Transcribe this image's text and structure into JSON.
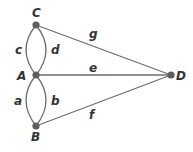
{
  "diagram": {
    "type": "graph",
    "colors": {
      "edge": "#6d6d6d",
      "node": "#5e5e5e",
      "text": "#333333"
    },
    "nodes": [
      {
        "id": "C",
        "label": "C",
        "x": 36,
        "y": 25
      },
      {
        "id": "A",
        "label": "A",
        "x": 36,
        "y": 75
      },
      {
        "id": "B",
        "label": "B",
        "x": 36,
        "y": 126
      },
      {
        "id": "D",
        "label": "D",
        "x": 171,
        "y": 75
      }
    ],
    "edges": [
      {
        "id": "a",
        "label": "a",
        "from": "A",
        "to": "B"
      },
      {
        "id": "b",
        "label": "b",
        "from": "A",
        "to": "B"
      },
      {
        "id": "c",
        "label": "c",
        "from": "A",
        "to": "C"
      },
      {
        "id": "d",
        "label": "d",
        "from": "A",
        "to": "C"
      },
      {
        "id": "e",
        "label": "e",
        "from": "A",
        "to": "D"
      },
      {
        "id": "f",
        "label": "f",
        "from": "B",
        "to": "D"
      },
      {
        "id": "g",
        "label": "g",
        "from": "C",
        "to": "D"
      }
    ]
  }
}
